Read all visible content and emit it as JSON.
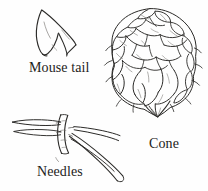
{
  "plate": {
    "title": "Conifer identification plate",
    "background_color": "#fefefe",
    "ink_color": "#2b2a28",
    "figures": [
      {
        "id": "mouse-tail",
        "label": "Mouse tail",
        "description": "Three-pointed bract resembling a mouse tail and hind feet",
        "label_position": {
          "x": 29,
          "y": 61
        }
      },
      {
        "id": "cone",
        "label": "Cone",
        "description": "Pendulous pine cone with dense overlapping scales and protruding bracts",
        "label_position": {
          "x": 149,
          "y": 137
        }
      },
      {
        "id": "needles",
        "label": "Needles",
        "description": "Fascicle of long slender needles bound by a sheath",
        "label_position": {
          "x": 37,
          "y": 165
        }
      }
    ]
  }
}
